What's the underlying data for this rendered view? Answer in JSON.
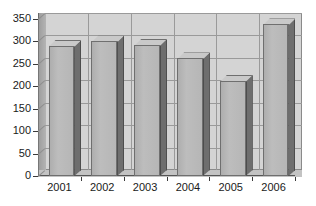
{
  "chart_data": {
    "type": "bar",
    "title": "",
    "subtitle": "",
    "xlabel": "",
    "ylabel": "",
    "categories": [
      "2001",
      "2002",
      "2003",
      "2004",
      "2005",
      "2006"
    ],
    "values": [
      290,
      300,
      292,
      262,
      212,
      338
    ],
    "series": [
      {
        "name": "",
        "values": [
          290,
          300,
          292,
          262,
          212,
          338
        ]
      }
    ],
    "ylim": [
      0,
      350
    ],
    "ytick_labels": [
      "0",
      "50",
      "100",
      "150",
      "200",
      "250",
      "300",
      "350"
    ],
    "ytick_values": [
      0,
      50,
      100,
      150,
      200,
      250,
      300,
      350
    ],
    "xtick_labels": [
      "2001",
      "2002",
      "2003",
      "2004",
      "2005",
      "2006"
    ],
    "grid": true,
    "grid_axis": "y",
    "legend": false,
    "legend_position": "none",
    "style": "3d-column",
    "colors": {
      "bar_front": "#b6b6b6",
      "bar_side": "#6e6e6e",
      "bar_top": "#c9c9c9",
      "plot_background": "#d4d4d4",
      "floor": "#c3c3c3",
      "gridline": "#9a9a9a",
      "axis": "#3a3a3a",
      "text": "#1a1a1a",
      "page_background": "#ffffff"
    }
  }
}
